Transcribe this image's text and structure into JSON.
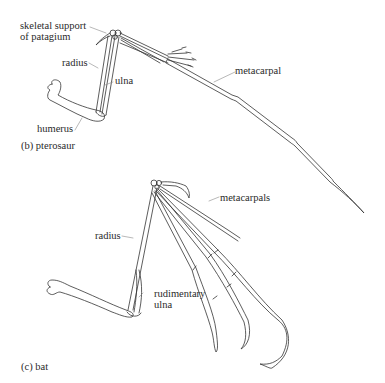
{
  "panels": [
    {
      "id": "pterosaur",
      "caption": "(b) pterosaur",
      "labels": {
        "skeletal_support_line1": "skeletal support",
        "skeletal_support_line2": "of patagium",
        "radius": "radius",
        "ulna": "ulna",
        "humerus": "humerus",
        "metacarpal": "metacarpal"
      }
    },
    {
      "id": "bat",
      "caption": "(c) bat",
      "labels": {
        "radius": "radius",
        "rudimentary_ulna_line1": "rudimentary",
        "rudimentary_ulna_line2": "ulna",
        "metacarpals": "metacarpals"
      }
    }
  ],
  "style": {
    "line_color": "#333333",
    "background": "#ffffff"
  }
}
